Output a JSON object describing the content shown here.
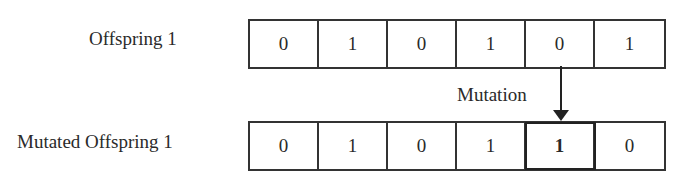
{
  "offspring": {
    "label": "Offspring 1",
    "genes": [
      "0",
      "1",
      "0",
      "1",
      "0",
      "1"
    ]
  },
  "mutated": {
    "label": "Mutated Offspring 1",
    "genes": [
      "0",
      "1",
      "0",
      "1",
      "1",
      "0"
    ],
    "mutated_index": 4
  },
  "arrow": {
    "label": "Mutation"
  }
}
